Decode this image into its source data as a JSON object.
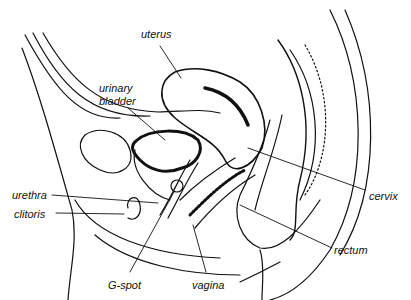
{
  "diagram": {
    "labels": [
      {
        "id": "uterus",
        "text": "uterus",
        "x": 141,
        "y": 34
      },
      {
        "id": "urinary-bladder-1",
        "text": "urinary",
        "x": 99,
        "y": 82
      },
      {
        "id": "urinary-bladder-2",
        "text": "bladder",
        "x": 99,
        "y": 95
      },
      {
        "id": "urethra",
        "text": "urethra",
        "x": 12,
        "y": 189
      },
      {
        "id": "clitoris",
        "text": "clitoris",
        "x": 14,
        "y": 208
      },
      {
        "id": "g-spot",
        "text": "G-spot",
        "x": 108,
        "y": 279
      },
      {
        "id": "vagina",
        "text": "vagina",
        "x": 192,
        "y": 279
      },
      {
        "id": "cervix",
        "text": "cervix",
        "x": 369,
        "y": 190
      },
      {
        "id": "rectum",
        "text": "rectum",
        "x": 334,
        "y": 244
      }
    ],
    "line_color": "#111111",
    "background": "#ffffff"
  }
}
